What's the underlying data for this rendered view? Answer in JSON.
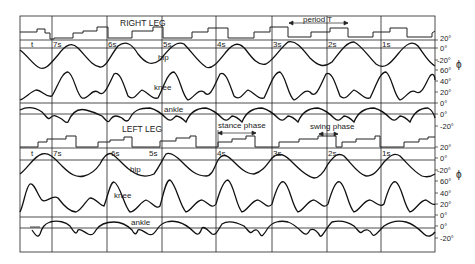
{
  "right_leg": {
    "title": "RIGHT LEG",
    "period_label": "period T",
    "time_label": "t",
    "times": [
      "7s",
      "6s",
      "5s",
      "4s",
      "3s",
      "2s",
      "1s"
    ],
    "traces": {
      "hip": "hip",
      "knee": "knee",
      "ankle": "ankle"
    },
    "axis": {
      "hip": [
        "20°",
        "0°",
        "-20°"
      ],
      "knee": [
        "60°",
        "40°",
        "20°",
        "0°"
      ],
      "ankle": [
        "0°",
        "-20°"
      ]
    },
    "phi": "ϕ"
  },
  "left_leg": {
    "title": "LEFT LEG",
    "stance_label": "stance phase",
    "swing_label": "swing phase",
    "time_label": "t",
    "times": [
      "7s",
      "6s",
      "5s",
      "4s",
      "3s",
      "2s",
      "1s"
    ],
    "traces": {
      "hip": "hip",
      "knee": "knee",
      "ankle": "ankle"
    },
    "axis": {
      "hip": [
        "20°",
        "0°",
        "-20°"
      ],
      "knee": [
        "60°",
        "40°",
        "20°",
        "0°"
      ],
      "ankle": [
        "0°",
        "-20°"
      ]
    },
    "phi": "ϕ"
  }
}
